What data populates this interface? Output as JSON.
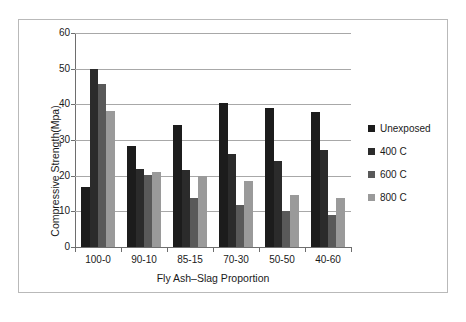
{
  "chart_data": {
    "type": "bar",
    "title": "",
    "xlabel": "Fly Ash–Slag Proportion",
    "ylabel": "Compressive Strength(Mpa)",
    "ylim": [
      0,
      60
    ],
    "yticks": [
      0,
      10,
      20,
      30,
      40,
      50,
      60
    ],
    "grid": true,
    "legend_position": "right",
    "categories": [
      "100-0",
      "90-10",
      "85-15",
      "70-30",
      "50-50",
      "40-60"
    ],
    "series": [
      {
        "name": "Unexposed",
        "color": "#1c1c1c",
        "values": [
          16.8,
          28.3,
          34.2,
          40.3,
          39.1,
          37.8
        ]
      },
      {
        "name": "400 C",
        "color": "#2b2b2b",
        "values": [
          50.0,
          22.0,
          21.5,
          26.0,
          24.0,
          27.1
        ]
      },
      {
        "name": "600 C",
        "color": "#595959",
        "values": [
          45.8,
          20.2,
          13.8,
          11.9,
          10.0,
          9.1
        ]
      },
      {
        "name": "800 C",
        "color": "#9a9a9a",
        "values": [
          38.0,
          21.0,
          20.0,
          18.4,
          14.5,
          13.7
        ]
      }
    ]
  },
  "legend": {
    "items": [
      {
        "label": "Unexposed",
        "color": "#1c1c1c"
      },
      {
        "label": "400 C",
        "color": "#2b2b2b"
      },
      {
        "label": "600 C",
        "color": "#595959"
      },
      {
        "label": "800 C",
        "color": "#9a9a9a"
      }
    ]
  },
  "axis": {
    "y_tick_labels": [
      "0",
      "10",
      "20",
      "30",
      "40",
      "50",
      "60"
    ],
    "x_tick_labels": [
      "100-0",
      "90-10",
      "85-15",
      "70-30",
      "50-50",
      "40-60"
    ],
    "y_title": "Compressive Strength(Mpa)",
    "x_title": "Fly Ash–Slag Proportion"
  }
}
